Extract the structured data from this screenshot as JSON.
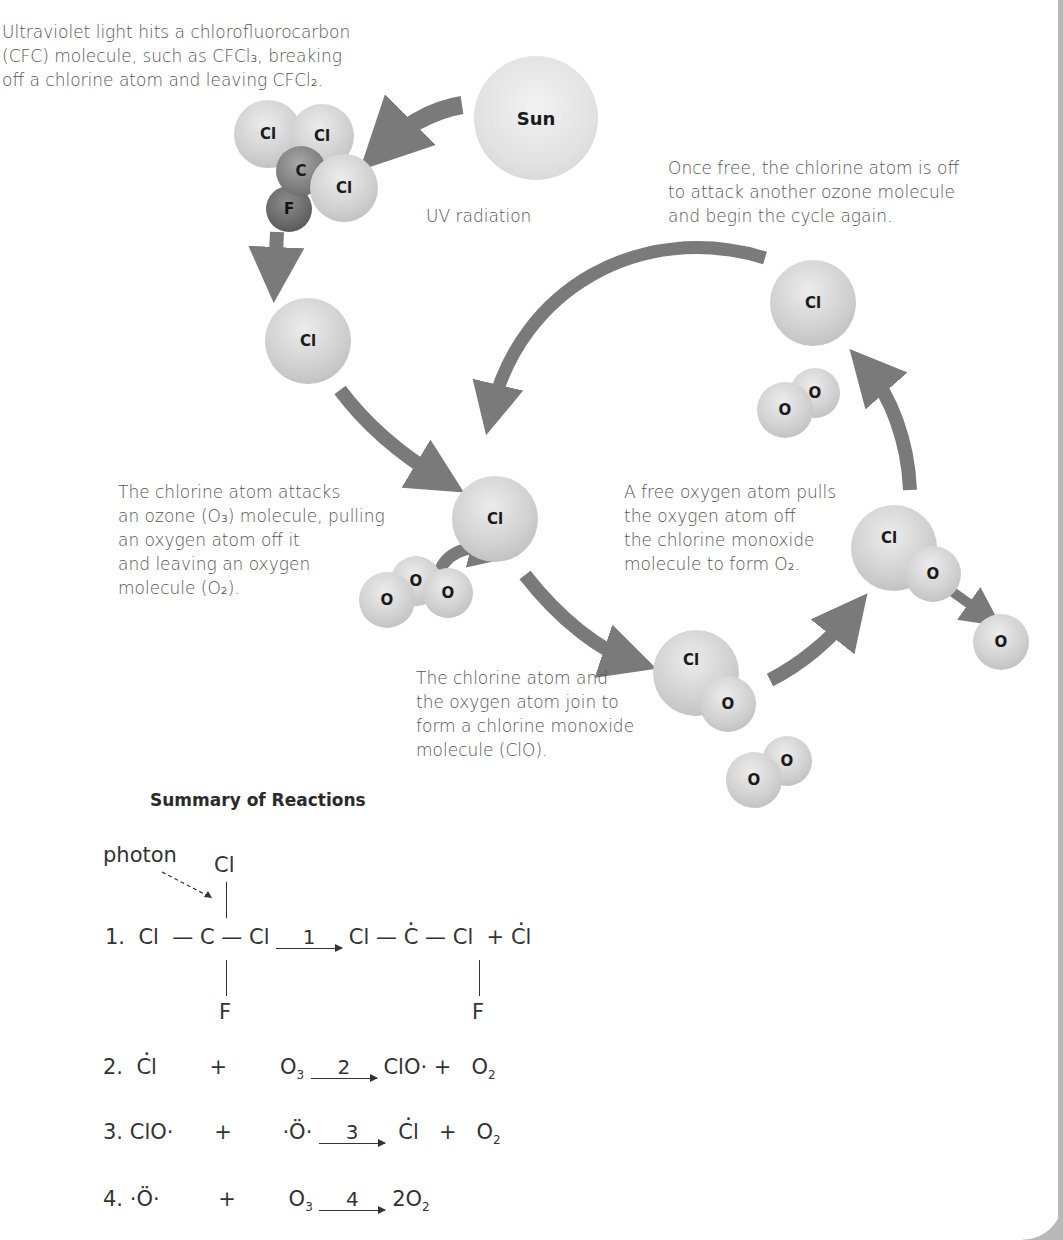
{
  "diagram": {
    "captions": {
      "step1": [
        "Ultraviolet light hits a chlorofluorocarbon",
        "(CFC) molecule, such as CFCl₃, breaking",
        "off a chlorine atom and leaving CFCl₂."
      ],
      "step_restart": [
        "Once free, the chlorine atom is off",
        "to attack another ozone molecule",
        "and begin the cycle again."
      ],
      "step2": [
        "The chlorine atom attacks",
        "an ozone (O₃) molecule, pulling",
        "an oxygen atom off it",
        "and leaving an oxygen",
        "molecule (O₂)."
      ],
      "step4": [
        "A free oxygen atom pulls",
        "the oxygen atom off",
        "the chlorine monoxide",
        "molecule to form O₂."
      ],
      "step3": [
        "The chlorine atom and",
        "the oxygen atom join to",
        "form a chlorine monoxide",
        "molecule (ClO)."
      ]
    },
    "sun_label": "Sun",
    "uv_label": "UV radiation",
    "atoms": {
      "cl": "Cl",
      "c": "C",
      "f": "F",
      "o": "O"
    },
    "colors": {
      "arrow": "#7a7a7a",
      "atom_light": "#d0d0d0",
      "atom_dark": "#6e6e6e",
      "text": "#555555"
    }
  },
  "summary": {
    "title": "Summary of Reactions",
    "photon_label": "photon",
    "reactions": [
      {
        "num": "1.",
        "arrow_label": "1",
        "reactants": "Cl — C — Cl (with Cl above, F below)",
        "products": "Cl — Ċ — Cl + Ċl (F below)"
      },
      {
        "num": "2.",
        "arrow_label": "2",
        "reactants": [
          "Ċl",
          "+",
          "O₃"
        ],
        "products": [
          "ClO·",
          "+",
          "O₂"
        ]
      },
      {
        "num": "3.",
        "arrow_label": "3",
        "reactants": [
          "ClO·",
          "+",
          "·Ö·"
        ],
        "products": [
          "Ċl",
          "+",
          "O₂"
        ]
      },
      {
        "num": "4.",
        "arrow_label": "4",
        "reactants": [
          "·Ö·",
          "+",
          "O₃"
        ],
        "products": [
          "2O₂"
        ]
      }
    ],
    "eq1": {
      "cl": "Cl",
      "c": "C",
      "f": "F",
      "plus": "+"
    },
    "eq2": {
      "cl": "Cl",
      "plus": "+",
      "o": "O",
      "sub3": "3",
      "clo": "ClO·",
      "sub2": "2"
    },
    "eq3": {
      "clo": "ClO·",
      "plus": "+",
      "orad": "·Ö·",
      "cl": "Cl",
      "o": "O",
      "sub2": "2"
    },
    "eq4": {
      "orad": "·Ö·",
      "plus": "+",
      "o": "O",
      "sub3": "3",
      "prod": "2O",
      "sub2": "2"
    }
  }
}
